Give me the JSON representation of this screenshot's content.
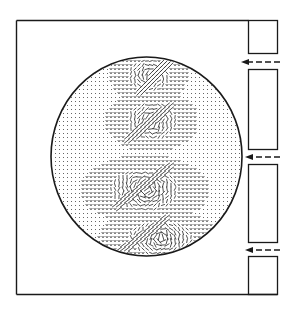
{
  "figure": {
    "background": "#ffffff",
    "ink": "#1a1a1a",
    "outer_frame": {
      "left": 16.5,
      "top": 20.5,
      "right": 277.5,
      "bottom": 294.5
    },
    "slot_column": {
      "left": 248.5,
      "right": 277.5
    },
    "wall_blocks": [
      {
        "top": 20.5,
        "bottom": 53.5
      },
      {
        "top": 69.5,
        "bottom": 149.5
      },
      {
        "top": 164.5,
        "bottom": 242.5
      },
      {
        "top": 256.5,
        "bottom": 294.5
      }
    ],
    "inlet_arrows": [
      {
        "y": 62,
        "x_tail": 280,
        "x_head": 241,
        "label": "inlet-jet-1"
      },
      {
        "y": 157,
        "x_tail": 280,
        "x_head": 245,
        "label": "inlet-jet-2"
      },
      {
        "y": 250,
        "x_tail": 280,
        "x_head": 245,
        "label": "inlet-jet-3"
      }
    ],
    "domain_circle": {
      "cx": 146.5,
      "cy": 156.5,
      "rx": 95.5,
      "ry": 99.5
    },
    "vector_field": {
      "grid_spacing": 4,
      "background_marker": "dot",
      "vortex_regions": [
        {
          "name": "upper-vortex",
          "cx": 149,
          "cy": 76,
          "rx": 22,
          "ry": 18,
          "intensity": 0.7
        },
        {
          "name": "upper-middle-vortex",
          "cx": 152,
          "cy": 121,
          "rx": 26,
          "ry": 20,
          "intensity": 0.85
        },
        {
          "name": "central-vortex",
          "cx": 145,
          "cy": 190,
          "rx": 36,
          "ry": 22,
          "intensity": 1.0
        },
        {
          "name": "lower-vortex",
          "cx": 160,
          "cy": 238,
          "rx": 34,
          "ry": 18,
          "intensity": 0.9
        }
      ],
      "shear_bands": [
        {
          "name": "upper-shear",
          "x1": 140,
          "y1": 92,
          "x2": 170,
          "y2": 60
        },
        {
          "name": "middle-shear",
          "x1": 130,
          "y1": 138,
          "x2": 170,
          "y2": 106
        },
        {
          "name": "central-shear",
          "x1": 118,
          "y1": 205,
          "x2": 168,
          "y2": 168
        },
        {
          "name": "lower-shear",
          "x1": 118,
          "y1": 254,
          "x2": 165,
          "y2": 220
        }
      ]
    }
  }
}
